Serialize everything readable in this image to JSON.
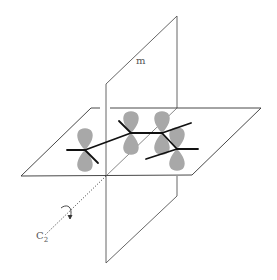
{
  "diagram": {
    "labels": {
      "mirror_plane": "m",
      "axis_main": "C",
      "axis_sub": "2"
    },
    "colors": {
      "line": "#333333",
      "bond": "#111111",
      "lobe": "#a8a8a8",
      "text": "#555555"
    }
  }
}
